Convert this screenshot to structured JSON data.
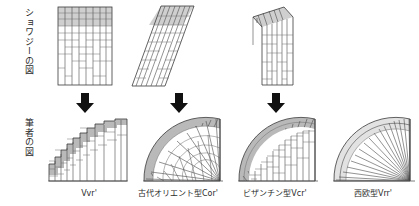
{
  "figure": {
    "row_labels": [
      {
        "id": "choisy",
        "text": "ショワジーの図"
      },
      {
        "id": "author",
        "text": "筆者の図"
      }
    ],
    "columns": [
      {
        "id": "vvr",
        "caption": "Vvr'",
        "has_top_diagram": true,
        "has_arrow": true,
        "top_kind": "rectangular-coursed-panel",
        "bottom_kind": "stepped-vertical-arch"
      },
      {
        "id": "cor",
        "caption": "古代オリエント型Cor'",
        "has_top_diagram": true,
        "has_arrow": true,
        "top_kind": "sheared-parallelogram-panel",
        "bottom_kind": "radial-inclined-dome"
      },
      {
        "id": "vcr",
        "caption": "ビザンチン型Vcr'",
        "has_top_diagram": true,
        "has_arrow": true,
        "top_kind": "slanted-cap-vertical-panel",
        "bottom_kind": "mixed-inclined-vertical-arch"
      },
      {
        "id": "vrr",
        "caption": "西欧型Vrr'",
        "has_top_diagram": false,
        "has_arrow": false,
        "top_kind": "",
        "bottom_kind": "fine-radial-voussoir-arch"
      }
    ],
    "arrow": {
      "glyph": "⬇",
      "name": "down-arrow",
      "color": "#111111"
    },
    "colors": {
      "line": "#4a4a4a",
      "outline": "#3a3a3a",
      "shade_dark": "#b9b9b9",
      "shade_mid": "#cfcfcf",
      "shade_light": "#e2e2e2",
      "background": "#ffffff",
      "text": "#2b2b2b"
    }
  }
}
